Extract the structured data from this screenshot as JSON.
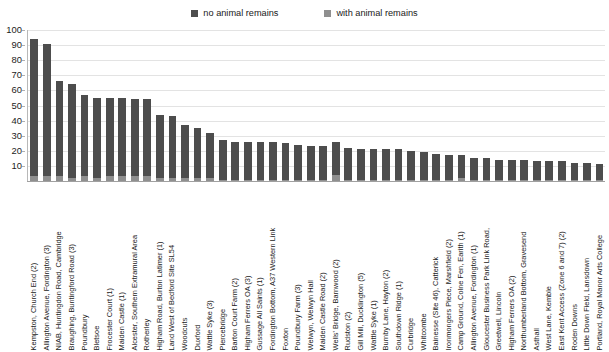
{
  "legend": {
    "position": "top-center",
    "entries": [
      {
        "label": "no animal remains",
        "color": "#4d4d4d",
        "icon": "legend-square-icon"
      },
      {
        "label": "with animal remains",
        "color": "#8f8f8f",
        "icon": "legend-square-icon"
      }
    ]
  },
  "chart_data": {
    "type": "bar",
    "subtype": "stacked-vertical",
    "title": "",
    "xlabel": "",
    "ylabel": "",
    "ylim": [
      0,
      100
    ],
    "ytick_step": 10,
    "ytick_labels": [
      "100",
      "90",
      "80",
      "70",
      "60",
      "50",
      "40",
      "30",
      "20",
      "10"
    ],
    "yticks": [
      100,
      90,
      80,
      70,
      60,
      50,
      40,
      30,
      20,
      10
    ],
    "grid": true,
    "grid_axis": "y",
    "legend_position": "top-center",
    "categories": [
      "Kempston, Church End (2)",
      "Allington Avenue, Fordington (3)",
      "NIAB, Huntingdon Road, Cambridge",
      "Braughing, Buntingford Road (3)",
      "Poundbury",
      "Bletsoe",
      "Frocester Court (1)",
      "Maiden Castle (1)",
      "Alcester, Southern Extramural Area",
      "Rotherley",
      "Higham Road, Burton Latimer (1)",
      "Land West of Bedford Site SL54",
      "Woodcuts",
      "Duxford",
      "Wattle Syke (3)",
      "Piercebridge",
      "Barton Court Farm (2)",
      "Higham Ferrers OA (3)",
      "Gussage All Saints (1)",
      "Fordington Bottom, A37 Western Link",
      "Foxton",
      "Poundbury Farm (3)",
      "Welwyn, Welwyn Hall",
      "Maiden Castle Road (2)",
      "Wells' Bridge, Barnwood (2)",
      "Rudston (2)",
      "Gill Mill, Ducklington (5)",
      "Wattle Syke (1)",
      "Burnby Lane, Hayton (2)",
      "Southdown Ridge (1)",
      "Curbridge",
      "Whitcombe",
      "Bainesse (Site 46), Catterick",
      "Ironmongers Piece, Marshfield (2)",
      "Camp Ground, Colne Fen, Earith (1)",
      "Allington Avenue, Fordington (1)",
      "Gloucester Business Park Link Road,",
      "Greetwell, Lincoln",
      "Higham Ferrers OA (2)",
      "Northumberland Bottom, Gravesend",
      "Asthall",
      "West Lane, Kemble",
      "East Kent Access (Zone 6 and 7) (2)",
      "Roden Downs",
      "Little Down Field, Lansdown",
      "Portland, Royal Manor Arts College"
    ],
    "series": [
      {
        "name": "no animal remains",
        "color": "#4d4d4d",
        "values": [
          91,
          88,
          63,
          62,
          54,
          53,
          52,
          52,
          51,
          51,
          42,
          41,
          35,
          33,
          30,
          26,
          25,
          25,
          25,
          25,
          24,
          23,
          22,
          22,
          22,
          21,
          20,
          20,
          20,
          20,
          19,
          18,
          17,
          16,
          15,
          14,
          14,
          13,
          13,
          13,
          12,
          12,
          12,
          11,
          11,
          10
        ]
      },
      {
        "name": "with animal remains",
        "color": "#8f8f8f",
        "values": [
          3,
          3,
          3,
          2,
          3,
          2,
          3,
          3,
          3,
          3,
          2,
          2,
          2,
          2,
          2,
          1,
          1,
          1,
          1,
          1,
          1,
          1,
          1,
          1,
          4,
          1,
          1,
          1,
          1,
          1,
          1,
          1,
          1,
          1,
          2,
          1,
          1,
          1,
          1,
          1,
          1,
          1,
          1,
          1,
          1,
          1
        ]
      }
    ],
    "totals": [
      94,
      91,
      66,
      64,
      57,
      55,
      55,
      55,
      54,
      54,
      44,
      43,
      37,
      35,
      32,
      27,
      26,
      26,
      26,
      26,
      25,
      24,
      23,
      23,
      26,
      22,
      21,
      21,
      21,
      21,
      20,
      19,
      18,
      17,
      17,
      15,
      15,
      14,
      14,
      14,
      13,
      13,
      13,
      12,
      12,
      11
    ]
  }
}
